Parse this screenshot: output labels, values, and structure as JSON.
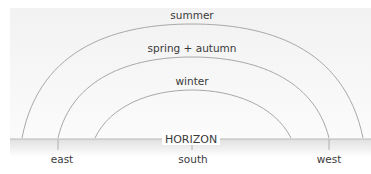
{
  "diagram": {
    "arcs": [
      {
        "label": "summer",
        "start_x": 22,
        "end_x": 363,
        "peak_y": 25
      },
      {
        "label": "spring + autumn",
        "start_x": 58,
        "end_x": 329,
        "peak_y": 57
      },
      {
        "label": "winter",
        "start_x": 95,
        "end_x": 291,
        "peak_y": 90
      }
    ],
    "horizon": {
      "label": "HORIZON",
      "y": 139
    },
    "directions": [
      {
        "label": "east",
        "x": 62
      },
      {
        "label": "south",
        "x": 192
      },
      {
        "label": "west",
        "x": 329
      }
    ],
    "colors": {
      "line": "#a8a8a8",
      "text": "#3a3a3a",
      "sky": "#f6f6f6",
      "band": "#e6e6e6"
    }
  }
}
